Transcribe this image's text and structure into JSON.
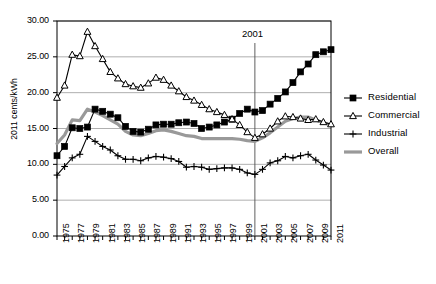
{
  "chart_data": {
    "type": "line",
    "title": "",
    "xlabel": "",
    "ylabel": "2011 cents/kWh",
    "xlim": [
      1975,
      2011
    ],
    "ylim": [
      0,
      30
    ],
    "ytick_labels": [
      "0.00",
      "5.00",
      "10.00",
      "15.00",
      "20.00",
      "25.00",
      "30.00"
    ],
    "ytick_values": [
      0,
      5,
      10,
      15,
      20,
      25,
      30
    ],
    "xtick_labels": [
      "1975",
      "1977",
      "1979",
      "1981",
      "1983",
      "1985",
      "1987",
      "1989",
      "1991",
      "1993",
      "1995",
      "1997",
      "1999",
      "2001",
      "2003",
      "2005",
      "2007",
      "2009",
      "2011"
    ],
    "xtick_values": [
      1975,
      1977,
      1979,
      1981,
      1983,
      1985,
      1987,
      1989,
      1991,
      1993,
      1995,
      1997,
      1999,
      2001,
      2003,
      2005,
      2007,
      2009,
      2011
    ],
    "grid": "horizontal",
    "legend_position": "right",
    "x": [
      1975,
      1976,
      1977,
      1978,
      1979,
      1980,
      1981,
      1982,
      1983,
      1984,
      1985,
      1986,
      1987,
      1988,
      1989,
      1990,
      1991,
      1992,
      1993,
      1994,
      1995,
      1996,
      1997,
      1998,
      1999,
      2000,
      2001,
      2002,
      2003,
      2004,
      2005,
      2006,
      2007,
      2008,
      2009,
      2010,
      2011
    ],
    "annotations": [
      {
        "label": "2001",
        "x": 2001,
        "type": "vertical-reference-line"
      }
    ],
    "series": [
      {
        "name": "Residential",
        "marker": "filled-square",
        "color": "#000000",
        "values": [
          11.2,
          12.5,
          15.1,
          15.0,
          15.2,
          17.7,
          17.4,
          17.0,
          16.5,
          15.3,
          14.6,
          14.5,
          14.9,
          15.5,
          15.6,
          15.6,
          15.8,
          15.9,
          15.7,
          15.0,
          15.2,
          15.5,
          15.9,
          16.3,
          17.1,
          17.7,
          17.3,
          17.5,
          18.4,
          19.2,
          20.1,
          21.4,
          22.9,
          24.0,
          25.3,
          25.7,
          26.0
        ]
      },
      {
        "name": "Commercial",
        "marker": "open-triangle",
        "color": "#000000",
        "values": [
          19.3,
          21.0,
          25.3,
          25.1,
          28.5,
          26.5,
          24.7,
          22.9,
          22.0,
          21.2,
          20.9,
          20.7,
          21.3,
          22.1,
          21.8,
          21.0,
          20.2,
          19.4,
          18.9,
          18.3,
          17.7,
          17.3,
          16.9,
          16.3,
          15.5,
          14.5,
          13.7,
          14.2,
          15.0,
          16.0,
          16.7,
          16.6,
          16.4,
          16.2,
          16.3,
          15.9,
          15.6
        ]
      },
      {
        "name": "Industrial",
        "marker": "plus",
        "color": "#000000",
        "values": [
          8.5,
          9.7,
          10.9,
          11.4,
          13.9,
          13.2,
          12.5,
          12.0,
          11.2,
          10.7,
          10.7,
          10.5,
          10.9,
          11.1,
          11.0,
          10.8,
          10.4,
          9.6,
          9.7,
          9.6,
          9.3,
          9.4,
          9.5,
          9.5,
          9.3,
          8.8,
          8.6,
          9.3,
          10.2,
          10.5,
          11.1,
          10.9,
          11.2,
          11.4,
          10.6,
          9.9,
          9.2
        ]
      },
      {
        "name": "Overall",
        "marker": "none",
        "color": "#999999",
        "values": [
          12.9,
          14.1,
          16.2,
          16.1,
          17.7,
          17.3,
          16.8,
          16.2,
          15.6,
          14.6,
          14.1,
          14.0,
          14.3,
          14.7,
          14.8,
          14.6,
          14.3,
          14.0,
          13.9,
          13.6,
          13.6,
          13.6,
          13.6,
          13.6,
          13.5,
          13.3,
          13.2,
          13.7,
          14.4,
          15.2,
          16.0,
          16.4,
          16.6,
          16.6,
          16.2,
          15.8,
          15.5
        ]
      }
    ]
  },
  "legend": {
    "items": [
      {
        "label": "Residential",
        "icon": "filled-square-line-marker"
      },
      {
        "label": "Commercial",
        "icon": "open-triangle-line-marker"
      },
      {
        "label": "Industrial",
        "icon": "plus-line-marker"
      },
      {
        "label": "Overall",
        "icon": "thick-gray-line-marker"
      }
    ]
  }
}
